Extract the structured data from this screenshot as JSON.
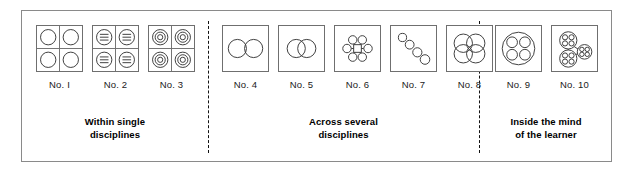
{
  "figure": {
    "groups": [
      {
        "id": "within-single-disciplines",
        "caption_line1": "Within single",
        "caption_line2": "disciplines",
        "items": [
          {
            "label": "No. I",
            "icon": "four-quadrant-plain-circles"
          },
          {
            "label": "No. 2",
            "icon": "four-quadrant-lined-circles"
          },
          {
            "label": "No. 3",
            "icon": "four-quadrant-concentric-circles"
          }
        ]
      },
      {
        "id": "across-several-disciplines",
        "caption_line1": "Across several",
        "caption_line2": "disciplines",
        "items": [
          {
            "label": "No. 4",
            "icon": "two-tangent-circles"
          },
          {
            "label": "No. 5",
            "icon": "two-overlapping-circles"
          },
          {
            "label": "No. 6",
            "icon": "square-hub-six-circles"
          },
          {
            "label": "No. 7",
            "icon": "diagonal-circle-chain"
          },
          {
            "label": "No. 8",
            "icon": "four-circle-rosette"
          }
        ]
      },
      {
        "id": "inside-the-mind-of-the-learner",
        "caption_line1": "Inside the mind",
        "caption_line2": "of the learner",
        "items": [
          {
            "label": "No. 9",
            "icon": "big-circle-four-inner-circles"
          },
          {
            "label": "No. 10",
            "icon": "three-linked-clusters"
          }
        ]
      }
    ],
    "colors": {
      "frame": "#8a8a8a",
      "cell_border": "#6f6f6f",
      "stroke": "#3a3a3a",
      "divider": "#111111",
      "text": "#1a1a1a",
      "background": "#ffffff"
    }
  }
}
